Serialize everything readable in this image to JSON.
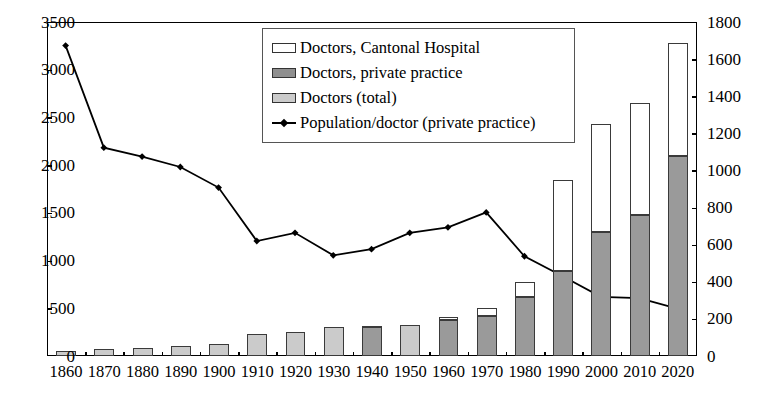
{
  "chart_data": {
    "type": "bar",
    "title": "",
    "subtitle": "",
    "xlabel": "",
    "ylabel": "",
    "y2label": "",
    "grid": false,
    "legend_position": "top-center",
    "categories": [
      "1860",
      "1870",
      "1880",
      "1890",
      "1900",
      "1910",
      "1920",
      "1930",
      "1940",
      "1950",
      "1960",
      "1970",
      "1980",
      "1990",
      "2000",
      "2010",
      "2020"
    ],
    "ylim": [
      0,
      3500
    ],
    "ytick_step": 500,
    "yticks": [
      0,
      500,
      1000,
      1500,
      2000,
      2500,
      3000,
      3500
    ],
    "y2lim": [
      0,
      1800
    ],
    "y2tick_step": 200,
    "y2ticks": [
      0,
      200,
      400,
      600,
      800,
      1000,
      1200,
      1400,
      1600,
      1800
    ],
    "series": [
      {
        "name": "Doctors (total)",
        "kind": "bar",
        "axis": "left",
        "color": "#cbcbcb",
        "values": [
          50,
          70,
          85,
          100,
          130,
          230,
          250,
          300,
          null,
          320,
          null,
          null,
          null,
          null,
          null,
          null,
          null
        ]
      },
      {
        "name": "Doctors, private practice",
        "kind": "bar-stack",
        "axis": "left",
        "color": "#9a9a9a",
        "values": [
          null,
          null,
          null,
          null,
          null,
          null,
          null,
          null,
          300,
          null,
          380,
          420,
          620,
          890,
          1300,
          1480,
          2100
        ]
      },
      {
        "name": "Doctors, Cantonal Hospital",
        "kind": "bar-stack",
        "axis": "left",
        "color": "#ffffff",
        "values": [
          null,
          null,
          null,
          null,
          null,
          null,
          null,
          null,
          15,
          null,
          30,
          80,
          160,
          950,
          1130,
          1170,
          1180
        ]
      },
      {
        "name": "Population/doctor (private practice)",
        "kind": "line",
        "axis": "right",
        "color": "#000000",
        "marker": "diamond",
        "values": [
          1670,
          1120,
          1072,
          1016,
          905,
          617,
          661,
          540,
          573,
          661,
          691,
          771,
          535,
          427,
          316,
          309,
          252
        ]
      }
    ],
    "bar_totals": [
      50,
      70,
      85,
      100,
      130,
      230,
      250,
      300,
      315,
      320,
      410,
      500,
      780,
      1840,
      2430,
      2650,
      3280
    ]
  },
  "legend": {
    "entries": [
      {
        "label": "Doctors, Cantonal Hospital",
        "swatch": "white"
      },
      {
        "label": "Doctors, private practice",
        "swatch": "dark"
      },
      {
        "label": "Doctors (total)",
        "swatch": "light"
      },
      {
        "label": "Population/doctor (private practice)",
        "swatch": "line-diamond"
      }
    ]
  }
}
